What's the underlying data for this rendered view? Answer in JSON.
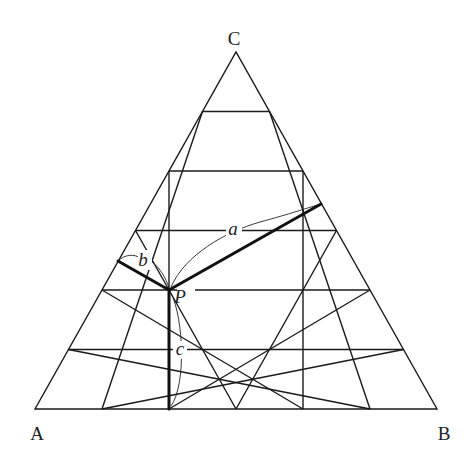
{
  "diagram": {
    "type": "ternary-triangle",
    "divisions": 6,
    "vertices": [
      {
        "id": "A",
        "label": "A",
        "x": 35,
        "y": 409,
        "label_x": 37,
        "label_y": 440
      },
      {
        "id": "B",
        "label": "B",
        "x": 437,
        "y": 409,
        "label_x": 444,
        "label_y": 440
      },
      {
        "id": "C",
        "label": "C",
        "x": 236,
        "y": 52,
        "label_x": 234,
        "label_y": 45
      }
    ],
    "point": {
      "label": "P",
      "x": 169,
      "y": 290,
      "label_x": 180,
      "label_y": 303
    },
    "distances": [
      {
        "label": "a",
        "to_side": "BC",
        "from": [
          169,
          290
        ],
        "to": [
          321,
          204
        ],
        "label_x": 233,
        "label_y": 235
      },
      {
        "label": "b",
        "to_side": "CA",
        "from": [
          169,
          290
        ],
        "to": [
          118,
          261
        ],
        "label_x": 143,
        "label_y": 266
      },
      {
        "label": "c",
        "to_side": "AB",
        "from": [
          169,
          290
        ],
        "to": [
          169,
          409
        ],
        "label_x": 180,
        "label_y": 355
      }
    ]
  },
  "colors": {
    "line": "#1a1a1a",
    "background": "#ffffff"
  }
}
